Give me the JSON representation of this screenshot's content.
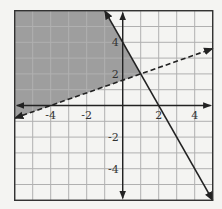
{
  "chart_data": {
    "type": "line",
    "title": "",
    "xlabel": "",
    "ylabel": "",
    "xlim": [
      -6,
      5
    ],
    "ylim": [
      -6,
      6
    ],
    "grid": true,
    "x_tick_labels": [
      {
        "value": -4,
        "label": "-4"
      },
      {
        "value": -2,
        "label": "-2"
      },
      {
        "value": 2,
        "label": "2"
      },
      {
        "value": 4,
        "label": "4"
      }
    ],
    "y_tick_labels": [
      {
        "value": 4,
        "label": "4"
      },
      {
        "value": 2,
        "label": "2"
      },
      {
        "value": -2,
        "label": "-2"
      },
      {
        "value": -4,
        "label": "-4"
      }
    ],
    "series": [
      {
        "name": "solid boundary line",
        "style": "solid",
        "equation": "y = -2x + 4",
        "points": [
          [
            -1,
            6
          ],
          [
            0,
            4
          ],
          [
            2,
            0
          ],
          [
            5,
            -6
          ]
        ]
      },
      {
        "name": "dashed boundary line",
        "style": "dashed",
        "equation": "y = 0.4x + 1.6",
        "points": [
          [
            -6,
            -0.8
          ],
          [
            0,
            1.6
          ],
          [
            1,
            2
          ],
          [
            5,
            3.6
          ]
        ]
      }
    ],
    "shaded_region": {
      "description": "Region above the dashed line and left of the solid line",
      "vertices": [
        [
          -6,
          6
        ],
        [
          -1,
          6
        ],
        [
          1,
          2
        ],
        [
          -6,
          -0.8
        ]
      ],
      "color": "#9e9e9e"
    },
    "colors": {
      "background": "#f4f4f2",
      "grid": "#b0b0b0",
      "axis": "#222222",
      "shade": "#9e9e9e",
      "line": "#222222"
    }
  }
}
